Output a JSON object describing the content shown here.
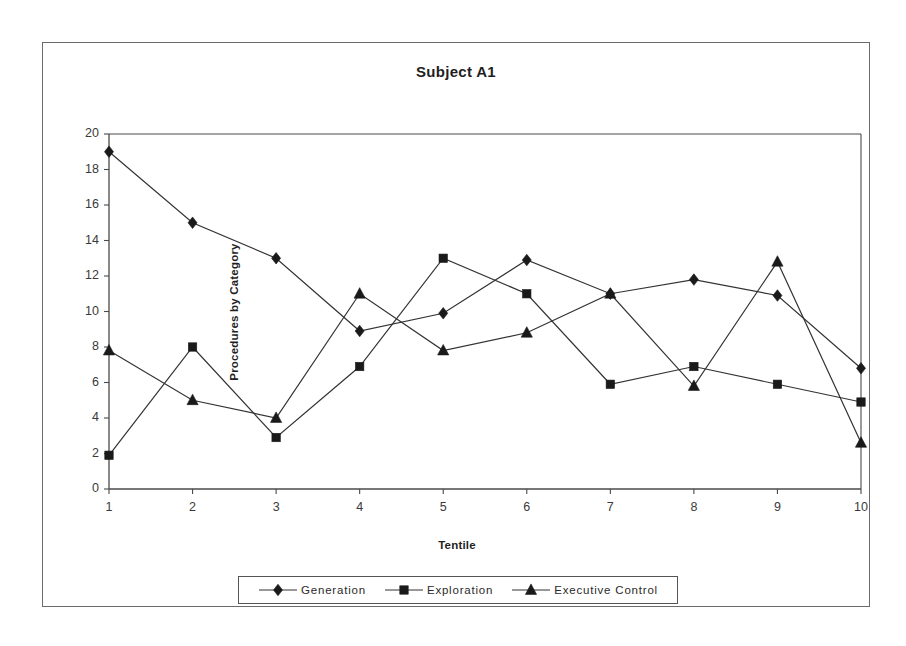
{
  "chart_data": {
    "type": "line",
    "title": "Subject A1",
    "xlabel": "Tentile",
    "ylabel": "Procedures by Category",
    "x": [
      1,
      2,
      3,
      4,
      5,
      6,
      7,
      8,
      9,
      10
    ],
    "xlim": [
      1,
      10
    ],
    "ylim": [
      0,
      20
    ],
    "ytick_step": 2,
    "yticks": [
      0,
      2,
      4,
      6,
      8,
      10,
      12,
      14,
      16,
      18,
      20
    ],
    "xticks": [
      "1",
      "2",
      "3",
      "4",
      "5",
      "6",
      "7",
      "8",
      "9",
      "10"
    ],
    "grid": false,
    "legend_position": "bottom",
    "line_color": "#333333",
    "marker_color": "#1a1a1a",
    "series": [
      {
        "name": "Generation",
        "marker": "diamond",
        "values": [
          19.0,
          15.0,
          13.0,
          8.9,
          9.9,
          12.9,
          11.0,
          11.8,
          10.9,
          6.8
        ]
      },
      {
        "name": "Exploration",
        "marker": "square",
        "values": [
          1.9,
          8.0,
          2.9,
          6.9,
          13.0,
          11.0,
          5.9,
          6.9,
          5.9,
          4.9
        ]
      },
      {
        "name": "Executive Control",
        "marker": "triangle",
        "values": [
          7.8,
          5.0,
          4.0,
          11.0,
          7.8,
          8.8,
          11.0,
          5.8,
          12.8,
          2.6
        ]
      }
    ]
  }
}
